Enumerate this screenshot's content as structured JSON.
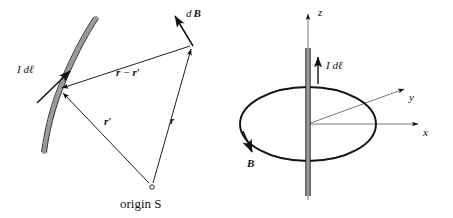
{
  "figure": {
    "caption_present": false,
    "background_color": "#ffffff",
    "ink_color": "#121212",
    "wire_fill_color": "#9a9a9a",
    "panels": [
      {
        "id": "left",
        "name": "biot-savart-general-geometry",
        "labels": {
          "current_element": "I dℓ",
          "field_vector": "dB",
          "field_vector_d": "d",
          "field_vector_b": "B",
          "separation_vector": "r − r′",
          "separation_r": "r",
          "separation_minus": "−",
          "separation_rprime": "r",
          "prime_mark": "′",
          "source_position_vector": "r′",
          "source_position_r": "r",
          "field_position_vector": "r",
          "origin": "origin S"
        },
        "geometry": {
          "source_point": [
            58,
            90
          ],
          "field_point": [
            192,
            45
          ],
          "origin_point": [
            152,
            187
          ]
        }
      },
      {
        "id": "right",
        "name": "straight-wire-field-loop",
        "labels": {
          "current_element": "I dℓ",
          "axis_x": "x",
          "axis_y": "y",
          "axis_z": "z",
          "field_label": "B"
        },
        "geometry": {
          "origin_point": [
            308,
            124
          ],
          "ellipse_rx": 68,
          "ellipse_ry": 37,
          "x_axis_end": [
            420,
            124
          ],
          "y_axis_end": [
            406,
            88
          ],
          "z_axis_end": [
            308,
            12
          ]
        }
      }
    ]
  }
}
